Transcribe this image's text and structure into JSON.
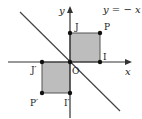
{
  "diagram": {
    "equation_label": "y = − x",
    "axes": {
      "x_label": "x",
      "y_label": "y",
      "origin_label": "O"
    },
    "colors": {
      "square_fill": "#bdbdbd",
      "stroke": "#333333",
      "point": "#111111"
    },
    "points": {
      "J": "J",
      "P": "P",
      "I": "I",
      "J_prime": "J′",
      "P_prime": "P′",
      "I_prime": "I′"
    },
    "shapes": [
      {
        "name": "square OJPI",
        "vertices": [
          "O",
          "J",
          "P",
          "I"
        ],
        "quadrant": "I"
      },
      {
        "name": "square OJ′P′I′",
        "vertices": [
          "O",
          "J′",
          "P′",
          "I′"
        ],
        "quadrant": "III"
      }
    ],
    "line": "y = -x"
  }
}
